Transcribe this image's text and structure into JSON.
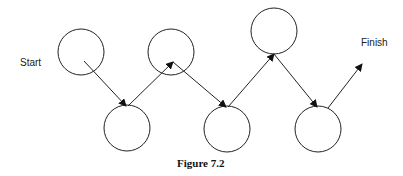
{
  "diagram": {
    "start_label": "Start",
    "finish_label": "Finish",
    "caption": "Figure 7.2",
    "nodes": [
      {
        "id": 1,
        "cx": 81,
        "cy": 52
      },
      {
        "id": 2,
        "cx": 127,
        "cy": 128
      },
      {
        "id": 3,
        "cx": 171,
        "cy": 52
      },
      {
        "id": 4,
        "cx": 227,
        "cy": 129
      },
      {
        "id": 5,
        "cx": 274,
        "cy": 31
      },
      {
        "id": 6,
        "cx": 318,
        "cy": 129
      }
    ],
    "edges": [
      {
        "from": 1,
        "to": 2
      },
      {
        "from": 2,
        "to": 3
      },
      {
        "from": 3,
        "to": 4
      },
      {
        "from": 4,
        "to": 5
      },
      {
        "from": 5,
        "to": 6
      },
      {
        "from": 6,
        "to": "finish"
      }
    ]
  }
}
